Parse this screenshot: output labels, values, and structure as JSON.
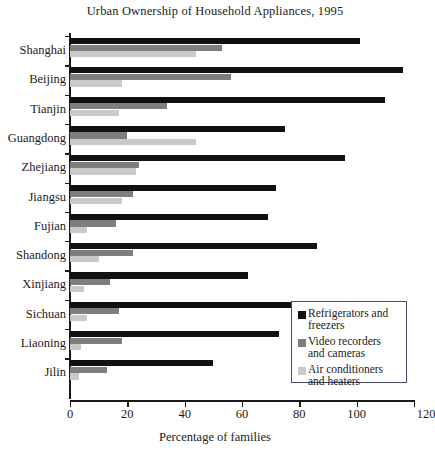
{
  "chart_data": {
    "type": "bar",
    "orientation": "horizontal",
    "title": "Urban Ownership of Household Appliances, 1995",
    "xlabel": "Percentage of families",
    "ylabel": "",
    "xlim": [
      0,
      120
    ],
    "xticks": [
      0,
      20,
      40,
      60,
      80,
      100,
      120
    ],
    "grid": false,
    "legend_position": "inside-lower-right",
    "categories": [
      "Shanghai",
      "Beijing",
      "Tianjin",
      "Guangdong",
      "Zhejiang",
      "Jiangsu",
      "Fujian",
      "Shandong",
      "Xinjiang",
      "Sichuan",
      "Liaoning",
      "Jilin"
    ],
    "series": [
      {
        "name": "Refrigerators and freezers",
        "color": "#111111",
        "values": [
          101,
          116,
          110,
          75,
          96,
          72,
          69,
          86,
          62,
          77,
          73,
          50
        ]
      },
      {
        "name": "Video recorders and cameras",
        "color": "#7e7e7e",
        "values": [
          53,
          56,
          34,
          20,
          24,
          22,
          16,
          22,
          14,
          17,
          18,
          13
        ]
      },
      {
        "name": "Air conditioners and heaters",
        "color": "#c9c9c9",
        "values": [
          44,
          18,
          17,
          44,
          23,
          18,
          6,
          10,
          5,
          6,
          4,
          3
        ]
      }
    ]
  },
  "legend": {
    "items": [
      {
        "label": "Refrigerators and\nfreezers",
        "color": "#111111",
        "swatch_name": "legend-swatch-refrigerators"
      },
      {
        "label": "Video recorders\nand cameras",
        "color": "#7e7e7e",
        "swatch_name": "legend-swatch-video-recorders"
      },
      {
        "label": "Air conditioners\nand heaters",
        "color": "#c9c9c9",
        "swatch_name": "legend-swatch-air-conditioners"
      }
    ]
  }
}
